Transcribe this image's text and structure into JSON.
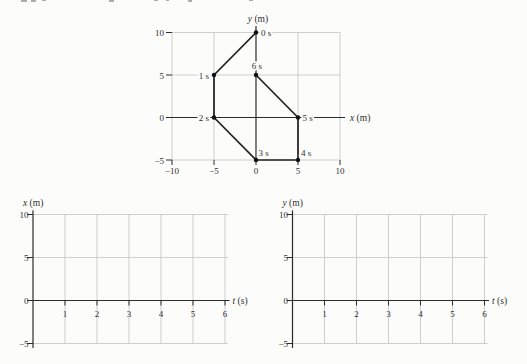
{
  "colors": {
    "background": "#fcfcfb",
    "grid": "#c9c9c9",
    "axis": "#2b2b2b",
    "trajectory": "#1f1f1f",
    "marker": "#111111",
    "text": "#2f2f2f"
  },
  "chart_data": [
    {
      "id": "trajectory",
      "type": "line",
      "xlabel": "x (m)",
      "ylabel": "y (m)",
      "xlim": [
        -10,
        10
      ],
      "ylim": [
        -5,
        10
      ],
      "xticks": [
        -10,
        -5,
        0,
        5,
        10
      ],
      "yticks": [
        -5,
        0,
        5,
        10
      ],
      "grid": true,
      "series": [
        {
          "name": "position-path",
          "points": [
            {
              "t": 0,
              "x": 0,
              "y": 10
            },
            {
              "t": 1,
              "x": -5,
              "y": 5
            },
            {
              "t": 2,
              "x": -5,
              "y": 0
            },
            {
              "t": 3,
              "x": 0,
              "y": -5
            },
            {
              "t": 4,
              "x": 5,
              "y": -5
            },
            {
              "t": 5,
              "x": 5,
              "y": 0
            },
            {
              "t": 6,
              "x": 0,
              "y": 5
            }
          ]
        }
      ],
      "point_labels": [
        {
          "text": "0 s",
          "x": 0,
          "y": 10,
          "anchor": "start",
          "dx": 5,
          "dy": 3.5
        },
        {
          "text": "1 s",
          "x": -5,
          "y": 5,
          "anchor": "end",
          "dx": -5,
          "dy": 3.5
        },
        {
          "text": "2 s",
          "x": -5,
          "y": 0,
          "anchor": "end",
          "dx": -5,
          "dy": 3.5
        },
        {
          "text": "3 s",
          "x": 0,
          "y": -5,
          "anchor": "start",
          "dx": 2.5,
          "dy": -4
        },
        {
          "text": "4 s",
          "x": 5,
          "y": -5,
          "anchor": "start",
          "dx": 3,
          "dy": -4
        },
        {
          "text": "5 s",
          "x": 5,
          "y": 0,
          "anchor": "start",
          "dx": 4.5,
          "dy": 3.5
        },
        {
          "text": "6 s",
          "x": 0,
          "y": 5,
          "anchor": "middle",
          "dx": 1,
          "dy": -6
        }
      ]
    },
    {
      "id": "x-vs-t",
      "type": "line",
      "xlabel": "t (s)",
      "ylabel": "x (m)",
      "xlim": [
        0,
        6.2
      ],
      "ylim": [
        -5,
        10
      ],
      "xticks": [
        1,
        2,
        3,
        4,
        5,
        6
      ],
      "yticks": [
        -5,
        0,
        5,
        10
      ],
      "grid": true,
      "series": []
    },
    {
      "id": "y-vs-t",
      "type": "line",
      "xlabel": "t (s)",
      "ylabel": "y (m)",
      "xlim": [
        0,
        6.2
      ],
      "ylim": [
        -5,
        10
      ],
      "xticks": [
        1,
        2,
        3,
        4,
        5,
        6
      ],
      "yticks": [
        -5,
        0,
        5,
        10
      ],
      "grid": true,
      "series": []
    }
  ]
}
